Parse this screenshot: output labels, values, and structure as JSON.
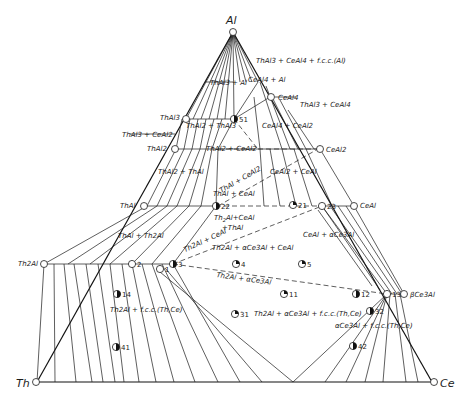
{
  "vertices": {
    "top": "Al",
    "left": "Th",
    "right": "Ce"
  },
  "compounds_left_edge": [
    "ThAl3",
    "ThAl2",
    "ThAl",
    "Th2Al"
  ],
  "compounds_right_edge": [
    "CeAl4",
    "CeAl2",
    "CeAl",
    "βCe3Al"
  ],
  "phase_field_labels": {
    "top_three_phase": "ThAl3 + CeAl4 + f.c.c.(Al)",
    "thal3_al": "ThAl3 + Al",
    "ceal4_al": "CeAl4 + Al",
    "thal3_ceal4": "ThAl3 + CeAl4",
    "thal2_thal3": "ThAl2 + ThAl3",
    "thal3_ceal2": "ThAl3 + CeAl2",
    "ceal4_ceal2": "CeAl4 + CeAl2",
    "thal2_ceal2": "ThAl2 + CeAl2",
    "thal2_thal": "ThAl2 + ThAl",
    "ceal2_ceal": "CeAl2 + CeAl",
    "thal_ceal2": "ThAl + CeAl2",
    "thal_ceal": "ThAl + CeAl",
    "th2al_ceal_thal": "Th2Al + CeAl + ThAl",
    "thal_th2al": "ThAl + Th2Al",
    "th2al_ceal": "Th2Al + CeAl",
    "th2al_ace3al_ceal": "Th2Al + αCe3Al + CeAl",
    "ceal_ace3al": "CeAl + αCe3Al",
    "th2al_ace3al": "Th2Al + αCe3Al",
    "th2al_fcc": "Th2Al + f.c.c.(Th,Ce)",
    "th2al_ace3al_fcc": "Th2Al + αCe3Al + f.c.c.(Th,Ce)",
    "ace3al_fcc": "αCe3Al + f.c.c.(Th,Ce)"
  },
  "sample_points": [
    {
      "id": "51",
      "x": 234,
      "y": 119,
      "fill": "half"
    },
    {
      "id": "22",
      "x": 216,
      "y": 206,
      "fill": "half"
    },
    {
      "id": "21",
      "x": 293,
      "y": 205,
      "fill": "quarter"
    },
    {
      "id": "23",
      "x": 322,
      "y": 206,
      "fill": "open"
    },
    {
      "id": "2",
      "x": 132,
      "y": 264,
      "fill": "open"
    },
    {
      "id": "3",
      "x": 173,
      "y": 264,
      "fill": "half"
    },
    {
      "id": "1",
      "x": 160,
      "y": 269,
      "fill": "open"
    },
    {
      "id": "4",
      "x": 236,
      "y": 264,
      "fill": "quarter"
    },
    {
      "id": "5",
      "x": 302,
      "y": 264,
      "fill": "quarter"
    },
    {
      "id": "11",
      "x": 284,
      "y": 294,
      "fill": "quarter"
    },
    {
      "id": "12",
      "x": 356,
      "y": 294,
      "fill": "half"
    },
    {
      "id": "13",
      "x": 387,
      "y": 294,
      "fill": "full"
    },
    {
      "id": "14",
      "x": 117,
      "y": 294,
      "fill": "half"
    },
    {
      "id": "31",
      "x": 235,
      "y": 314,
      "fill": "quarter"
    },
    {
      "id": "32",
      "x": 370,
      "y": 311,
      "fill": "half"
    },
    {
      "id": "41",
      "x": 116,
      "y": 347,
      "fill": "half"
    },
    {
      "id": "42",
      "x": 353,
      "y": 346,
      "fill": "half"
    }
  ]
}
